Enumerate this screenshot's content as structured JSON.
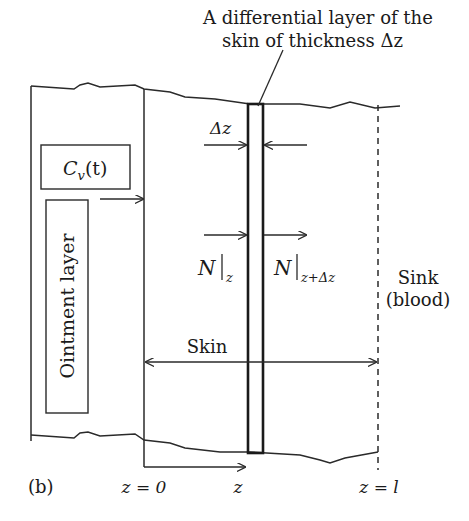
{
  "caption": {
    "line1": "A differential layer of the",
    "line2": "skin of thickness Δz"
  },
  "labels": {
    "concentration": "C",
    "concentration_sub": "v",
    "concentration_arg": "(t)",
    "ointment": "Ointment layer",
    "delta_z": "Δz",
    "flux_in": "N",
    "flux_in_sub": "z",
    "flux_out": "N",
    "flux_out_sub": "z+Δz",
    "sink_line1": "Sink",
    "sink_line2": "(blood)",
    "skin": "Skin",
    "panel": "(b)",
    "z0": "z = 0",
    "z": "z",
    "zl": "z = l"
  },
  "colors": {
    "stroke": "#2a2a2a",
    "background": "#ffffff"
  }
}
